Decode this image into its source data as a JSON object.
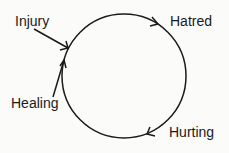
{
  "diagram": {
    "type": "cycle",
    "labels": {
      "injury": "Injury",
      "hatred": "Hatred",
      "hurting": "Hurting",
      "healing": "Healing"
    },
    "colors": {
      "ink": "#1a1a1a",
      "background": "#fbfbf9"
    }
  }
}
